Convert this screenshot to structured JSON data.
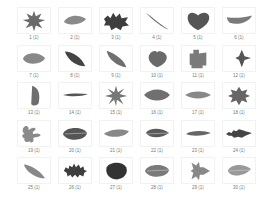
{
  "gallery": {
    "columns": 6,
    "rows": 5,
    "items": [
      {
        "label": "1 (1)",
        "shape": "maple",
        "color": "#6a6a6a"
      },
      {
        "label": "2 (1)",
        "shape": "teardrop",
        "color": "#8a8a8a"
      },
      {
        "label": "3 (1)",
        "shape": "holly",
        "color": "#3e3e3e"
      },
      {
        "label": "4 (1)",
        "shape": "needle-diag",
        "color": "#6a6a6a"
      },
      {
        "label": "5 (1)",
        "shape": "heart",
        "color": "#555555"
      },
      {
        "label": "6 (1)",
        "shape": "crescent",
        "color": "#7a7a7a"
      },
      {
        "label": "7 (1)",
        "shape": "oval",
        "color": "#888888"
      },
      {
        "label": "8 (1)",
        "shape": "lanceolate",
        "color": "#444444"
      },
      {
        "label": "9 (1)",
        "shape": "elliptic-diag",
        "color": "#6f6f6f"
      },
      {
        "label": "10 (1)",
        "shape": "cordate",
        "color": "#6a6a6a"
      },
      {
        "label": "11 (1)",
        "shape": "lobed-square",
        "color": "#7a7a7a"
      },
      {
        "label": "12 (1)",
        "shape": "arrow",
        "color": "#555555"
      },
      {
        "label": "13 (1)",
        "shape": "half-oval",
        "color": "#6e6e6e"
      },
      {
        "label": "14 (1)",
        "shape": "thin-line",
        "color": "#555555"
      },
      {
        "label": "15 (1)",
        "shape": "star",
        "color": "#777777"
      },
      {
        "label": "16 (1)",
        "shape": "lens",
        "color": "#707070"
      },
      {
        "label": "17 (1)",
        "shape": "lens-thin",
        "color": "#888888"
      },
      {
        "label": "18 (1)",
        "shape": "star-lobed",
        "color": "#666666"
      },
      {
        "label": "19 (1)",
        "shape": "fig",
        "color": "#8a8a8a"
      },
      {
        "label": "20 (1)",
        "shape": "round-veined",
        "color": "#555555"
      },
      {
        "label": "21 (1)",
        "shape": "teardrop-long",
        "color": "#888888"
      },
      {
        "label": "22 (1)",
        "shape": "pointed-oval",
        "color": "#5a5a5a"
      },
      {
        "label": "23 (1)",
        "shape": "spindle",
        "color": "#666666"
      },
      {
        "label": "24 (1)",
        "shape": "spindle-toothed",
        "color": "#444444"
      },
      {
        "label": "25 (1)",
        "shape": "lanceolate-diag",
        "color": "#888888"
      },
      {
        "label": "26 (1)",
        "shape": "oak",
        "color": "#3e3e3e"
      },
      {
        "label": "27 (1)",
        "shape": "round-dark",
        "color": "#333333"
      },
      {
        "label": "28 (1)",
        "shape": "round-veined",
        "color": "#7a7a7a"
      },
      {
        "label": "29 (1)",
        "shape": "arrow-lobed",
        "color": "#888888"
      },
      {
        "label": "30 (1)",
        "shape": "teardrop-pale",
        "color": "#999999"
      }
    ]
  }
}
